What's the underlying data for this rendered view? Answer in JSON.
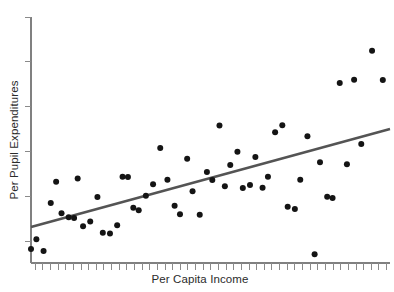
{
  "chart_data": {
    "type": "scatter",
    "title": "",
    "xlabel": "Per Capita Income",
    "ylabel": "Per Pupil Expenditures",
    "grid": false,
    "legend": false,
    "legend_position": "none",
    "xlim": [
      0,
      100
    ],
    "ylim": [
      0,
      100
    ],
    "x_tick_labels": [],
    "y_tick_labels": [],
    "x_tick_count": 47,
    "y_tick_count": 6,
    "marker": {
      "shape": "circle",
      "color": "#141414",
      "size_px": 6
    },
    "trendline": {
      "type": "linear-fit",
      "color": "#545454",
      "width_px": 2.6,
      "x_start": 0.0,
      "y_start": 14.6,
      "x_end": 100.0,
      "y_end": 54.5
    },
    "x": [
      0.0,
      1.5,
      3.5,
      5.5,
      7.0,
      8.5,
      10.5,
      12.0,
      13.0,
      14.5,
      16.5,
      18.5,
      20.0,
      22.0,
      24.0,
      25.5,
      27.0,
      28.5,
      30.0,
      32.0,
      34.0,
      36.0,
      38.0,
      40.0,
      41.5,
      43.5,
      45.0,
      47.0,
      49.0,
      50.5,
      52.5,
      54.0,
      55.5,
      57.5,
      59.0,
      61.0,
      62.5,
      64.5,
      66.0,
      68.0,
      70.0,
      71.5,
      73.5,
      75.0,
      77.0,
      79.0,
      80.5,
      82.5,
      84.0,
      86.0,
      88.0,
      90.0,
      92.0,
      95.0,
      98.0
    ],
    "y": [
      5.7,
      9.7,
      4.9,
      24.4,
      33.0,
      20.2,
      18.6,
      18.3,
      34.3,
      14.9,
      16.9,
      26.8,
      12.3,
      12.0,
      15.3,
      35.1,
      35.0,
      22.5,
      21.4,
      27.3,
      32.0,
      46.7,
      33.8,
      23.3,
      19.8,
      42.4,
      29.2,
      19.6,
      37.0,
      33.7,
      55.9,
      31.2,
      39.8,
      45.2,
      30.5,
      31.7,
      43.1,
      30.6,
      35.1,
      53.2,
      56.0,
      22.9,
      22.0,
      33.8,
      51.5,
      3.6,
      41.0,
      26.9,
      26.4,
      73.2,
      40.1,
      74.5,
      48.4,
      86.3,
      74.4
    ]
  }
}
